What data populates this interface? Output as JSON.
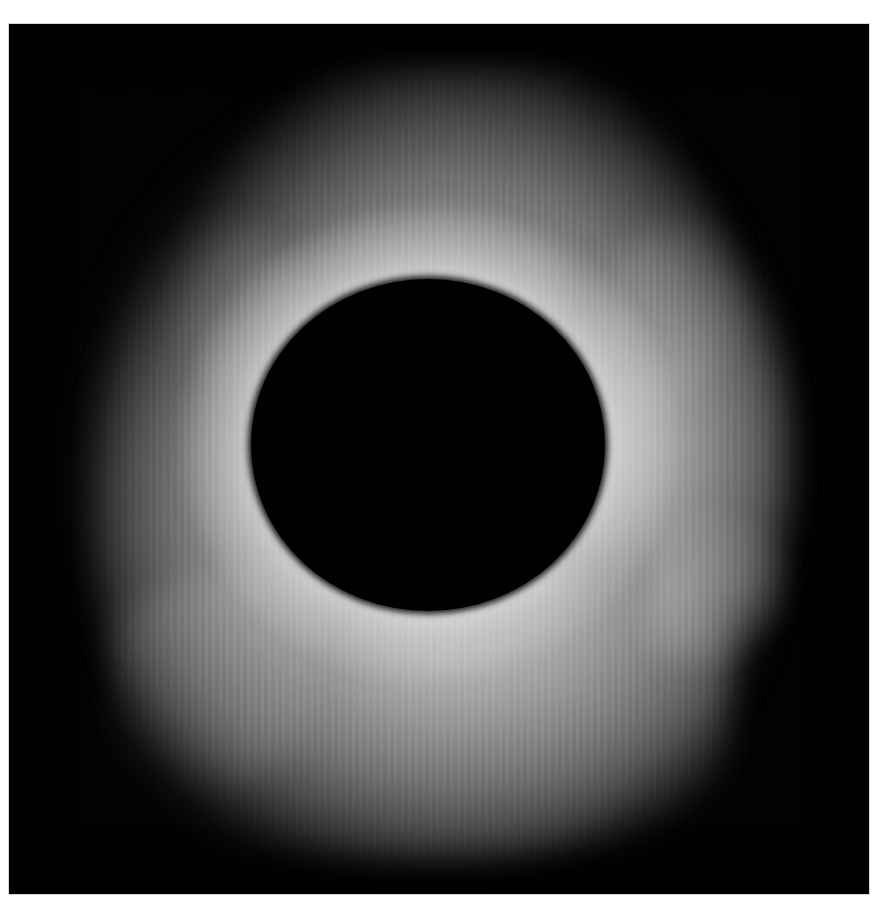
{
  "image": {
    "subject": "total solar eclipse",
    "elements": [
      "photo-frame",
      "solar-corona",
      "moon-disk"
    ],
    "colors": {
      "page_background": "#ffffff",
      "sky": "#020202",
      "corona_peak": "#f0f0f0",
      "corona_mid": "#a0a0a0",
      "moon": "#000000"
    }
  }
}
